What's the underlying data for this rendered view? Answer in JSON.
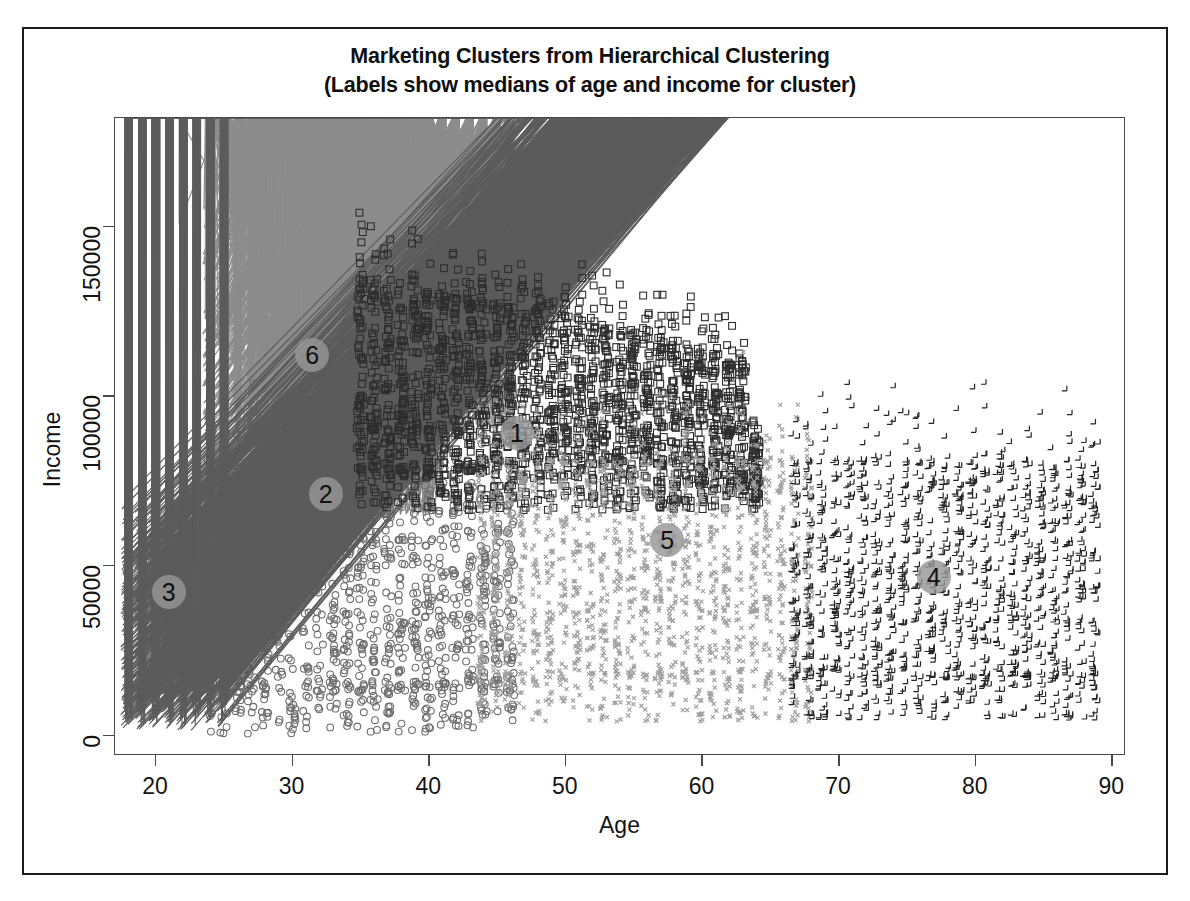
{
  "figure": {
    "title_line1": "Marketing Clusters from Hierarchical Clustering",
    "title_line2": "(Labels show medians of age and income for cluster)"
  },
  "chart_data": {
    "type": "scatter",
    "title": "Marketing Clusters from Hierarchical Clustering (Labels show medians of age and income for cluster)",
    "xlabel": "Age",
    "ylabel": "Income",
    "xlim": [
      17,
      91
    ],
    "ylim": [
      -6000,
      182000
    ],
    "xticks": [
      20,
      30,
      40,
      50,
      60,
      70,
      80,
      90
    ],
    "yticks": [
      0,
      50000,
      100000,
      150000
    ],
    "grid": false,
    "legend": "none",
    "point_count_approx": 9000,
    "cluster_labels": [
      {
        "id": "1",
        "label": "1",
        "median_age": 46.5,
        "median_income": 89000,
        "marker": "square",
        "color": "#2b2b2b"
      },
      {
        "id": "2",
        "label": "2",
        "median_age": 32.5,
        "median_income": 71000,
        "marker": "circle",
        "color": "#6b6b6b"
      },
      {
        "id": "3",
        "label": "3",
        "median_age": 21.0,
        "median_income": 42000,
        "marker": "triangle",
        "color": "#5a5a5a"
      },
      {
        "id": "4",
        "label": "4",
        "median_age": 77.0,
        "median_income": 46500,
        "marker": "plus",
        "color": "#1f1f1f"
      },
      {
        "id": "5",
        "label": "5",
        "median_age": 57.5,
        "median_income": 57500,
        "marker": "cross",
        "color": "#9a9a9a"
      },
      {
        "id": "6",
        "label": "6",
        "median_age": 31.5,
        "median_income": 112000,
        "marker": "diamond",
        "color": "#8a8a8a"
      }
    ],
    "series": [
      {
        "name": "Cluster 6",
        "marker": "diamond",
        "color": "#8c8c8c",
        "n": 1500,
        "age_range": [
          24,
          46
        ],
        "income_range": [
          88000,
          178000
        ],
        "age_median": 31.5,
        "income_median": 112000
      },
      {
        "name": "Cluster 2",
        "marker": "circle",
        "color": "#6e6e6e",
        "n": 1400,
        "age_range": [
          24,
          46
        ],
        "income_range": [
          0,
          88000
        ],
        "age_median": 32.5,
        "income_median": 71000
      },
      {
        "name": "Cluster 3",
        "marker": "triangle",
        "color": "#5c5c5c",
        "n": 1200,
        "age_range": [
          18,
          25
        ],
        "income_range": [
          1000,
          57000
        ],
        "age_median": 21.0,
        "income_median": 42000
      },
      {
        "name": "Cluster 1",
        "marker": "square",
        "color": "#2e2e2e",
        "n": 2200,
        "age_range": [
          35,
          64
        ],
        "income_range": [
          66000,
          140000
        ],
        "age_median": 46.5,
        "income_median": 89000
      },
      {
        "name": "Cluster 5",
        "marker": "cross",
        "color": "#a0a0a0",
        "n": 1800,
        "age_range": [
          44,
          68
        ],
        "income_range": [
          3000,
          88000
        ],
        "age_median": 57.5,
        "income_median": 57500
      },
      {
        "name": "Cluster 4",
        "marker": "plus",
        "color": "#242424",
        "n": 1400,
        "age_range": [
          67,
          89
        ],
        "income_range": [
          4000,
          87000
        ],
        "age_median": 77.0,
        "income_median": 46500
      }
    ]
  },
  "axes": {
    "x_ticks": [
      {
        "value": 20,
        "label": "20"
      },
      {
        "value": 30,
        "label": "30"
      },
      {
        "value": 40,
        "label": "40"
      },
      {
        "value": 50,
        "label": "50"
      },
      {
        "value": 60,
        "label": "60"
      },
      {
        "value": 70,
        "label": "70"
      },
      {
        "value": 80,
        "label": "80"
      },
      {
        "value": 90,
        "label": "90"
      }
    ],
    "y_ticks": [
      {
        "value": 0,
        "label": "0"
      },
      {
        "value": 50000,
        "label": "50000"
      },
      {
        "value": 100000,
        "label": "100000"
      },
      {
        "value": 150000,
        "label": "150000"
      }
    ],
    "x_title": "Age",
    "y_title": "Income"
  }
}
